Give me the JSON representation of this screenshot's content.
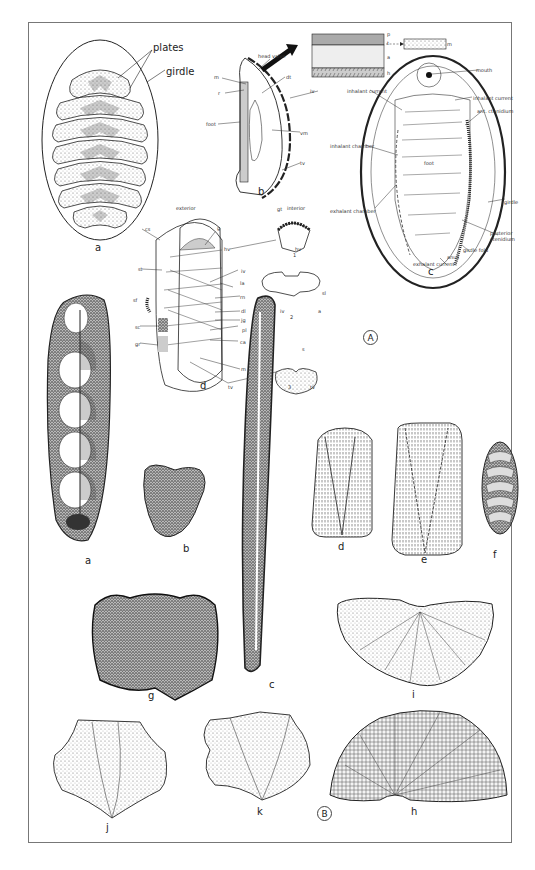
{
  "plate": {
    "section_a_marker": "A",
    "section_b_marker": "B"
  },
  "section_a": {
    "fig_a": {
      "letter": "a",
      "labels": {
        "plates": "plates",
        "girdle": "girdle"
      }
    },
    "fig_b": {
      "letter": "b",
      "labels": {
        "head_valve": "head valve",
        "m": "m",
        "r": "r",
        "dt": "dt",
        "iv": "iv",
        "foot": "foot",
        "vm": "vm",
        "tv": "tv"
      },
      "shell_layers": {
        "p": "p",
        "t": "t",
        "a": "a",
        "h": "h",
        "m": "m"
      }
    },
    "fig_c": {
      "letter": "c",
      "labels": {
        "mouth": "mouth",
        "inhalant_current_left": "inhalant current",
        "inhalant_current_right": "inhalant current",
        "ant_ctenidium": "ant. ctenidium",
        "inhalant_chamber": "inhalant chamber",
        "foot": "foot",
        "exhalant_chamber": "exhalant chamber",
        "girdle": "girdle",
        "posterior_ctenidium": "posterior ctenidium",
        "girdle_fold": "girdle fold",
        "anus": "anus",
        "exhalant_current": "exhalant current"
      }
    },
    "fig_d": {
      "letter": "d",
      "headers": {
        "exterior": "exterior",
        "interior": "interior"
      },
      "labels": {
        "cs": "cs",
        "g": "g",
        "hv": "hv",
        "st": "st",
        "iv": "iv",
        "la": "la",
        "sf": "sf",
        "rn": "rn",
        "dl": "dl",
        "sc": "sc",
        "jg": "jg",
        "pl": "pl",
        "gr": "gr",
        "ca": "ca",
        "m": "m",
        "tv": "tv"
      },
      "subfigures": [
        {
          "number": "1",
          "labels": [
            "gt",
            "hv"
          ]
        },
        {
          "number": "2",
          "labels": [
            "iv",
            "sl",
            "a",
            "iv"
          ]
        },
        {
          "number": "3",
          "labels": [
            "s",
            "tv",
            "tv"
          ]
        }
      ]
    }
  },
  "section_b": {
    "figures": [
      {
        "letter": "a"
      },
      {
        "letter": "b"
      },
      {
        "letter": "c"
      },
      {
        "letter": "d"
      },
      {
        "letter": "e"
      },
      {
        "letter": "f"
      },
      {
        "letter": "g"
      },
      {
        "letter": "h"
      },
      {
        "letter": "i"
      },
      {
        "letter": "j"
      },
      {
        "letter": "k"
      }
    ]
  },
  "colors": {
    "ink": "#222222",
    "frame": "#777777",
    "stipple": "#9a9a9a",
    "shell_gray": "#b8b8b8",
    "dark_fill": "#3a3a3a"
  }
}
